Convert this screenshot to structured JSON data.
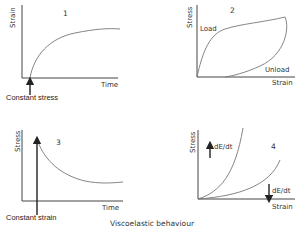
{
  "caption": "Viscoelastic behaviour",
  "panels": [
    {
      "number": "1",
      "ylabel": "Strain",
      "xlabel": "Time",
      "annotation": "Constant stress",
      "curve": "creep"
    },
    {
      "number": "2",
      "ylabel": "Stress",
      "xlabel": "Strain",
      "load_label": "Load",
      "unload_label": "Unload",
      "curve": "hysteresis"
    },
    {
      "number": "3",
      "ylabel": "Stress",
      "xlabel": "Time",
      "annotation": "Constant strain",
      "curve": "stress-relaxation"
    },
    {
      "number": "4",
      "ylabel": "Stress",
      "xlabel": "Strain",
      "rate_up_label": "dE/dt",
      "rate_down_label": "dE/dt",
      "curve": "strain-rate-dependence"
    }
  ]
}
